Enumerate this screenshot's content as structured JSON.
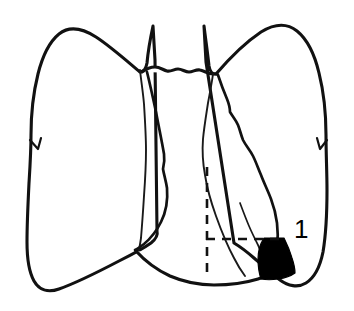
{
  "figure": {
    "view": "anterior",
    "background_color": "#ffffff",
    "ink_color": "#111111",
    "highlight_color": "#000000"
  },
  "labels": [
    {
      "id": "segment-1",
      "text": "1",
      "x": 302,
      "y": 231,
      "points_to": "black-shaded-segment"
    }
  ],
  "parts": [
    {
      "name": "right-lung-outline",
      "side": "image-left",
      "filled": false
    },
    {
      "name": "left-lung-outline",
      "side": "image-right",
      "filled": false
    },
    {
      "name": "mediastinal-border",
      "filled": false
    },
    {
      "name": "oblique-fissure",
      "filled": false
    },
    {
      "name": "black-shaded-segment",
      "filled": true,
      "fill_color": "#000000",
      "label": "1"
    }
  ],
  "guides": {
    "vertical_dashed": {
      "x": 207,
      "y_start": 167,
      "y_end": 274
    },
    "horizontal_dashed": {
      "y": 239,
      "x_start": 206,
      "x_end": 280
    },
    "style": "dashed"
  }
}
